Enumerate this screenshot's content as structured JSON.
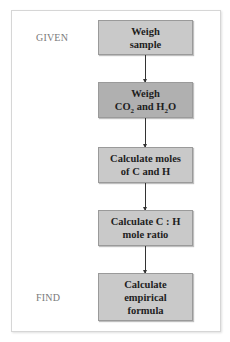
{
  "labels": {
    "given": "GIVEN",
    "find": "FIND"
  },
  "steps": [
    {
      "line1": "Weigh",
      "line2": "sample"
    },
    {
      "line1": "Weigh",
      "co2_main": "CO",
      "co2_sub": "2",
      "and": " and H",
      "h2o_sub": "2",
      "h2o_end": "O"
    },
    {
      "line1": "Calculate moles",
      "line2": "of C and H"
    },
    {
      "line1": "Calculate C : H",
      "line2": "mole ratio"
    },
    {
      "line1": "Calculate",
      "line2": "empirical",
      "line3": "formula"
    }
  ],
  "colors": {
    "box_light": "#c9c9c9",
    "box_dark": "#b0b0b0",
    "label": "#7a7a7a"
  }
}
